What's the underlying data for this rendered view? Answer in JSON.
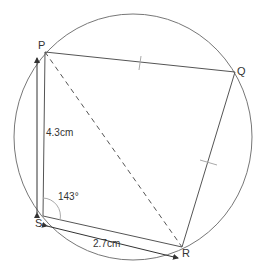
{
  "diagram": {
    "type": "cyclic quadrilateral in circle",
    "points": {
      "P": {
        "label": "P",
        "x": 45,
        "y": 52
      },
      "Q": {
        "label": "Q",
        "x": 235,
        "y": 72
      },
      "R": {
        "label": "R",
        "x": 182,
        "y": 247
      },
      "S": {
        "label": "S",
        "x": 43,
        "y": 216
      }
    },
    "circle": {
      "cx": 133,
      "cy": 137,
      "rx": 119,
      "ry": 123
    },
    "annotations": {
      "ps_length": "4.3cm",
      "sr_length": "2.7cm",
      "angle_s": "143°"
    },
    "equal_marks": [
      "PQ",
      "QR"
    ],
    "dashed_diagonal": "PR",
    "colors": {
      "line": "#555555",
      "circle": "#777777",
      "mark": "#aaaaaa"
    }
  }
}
